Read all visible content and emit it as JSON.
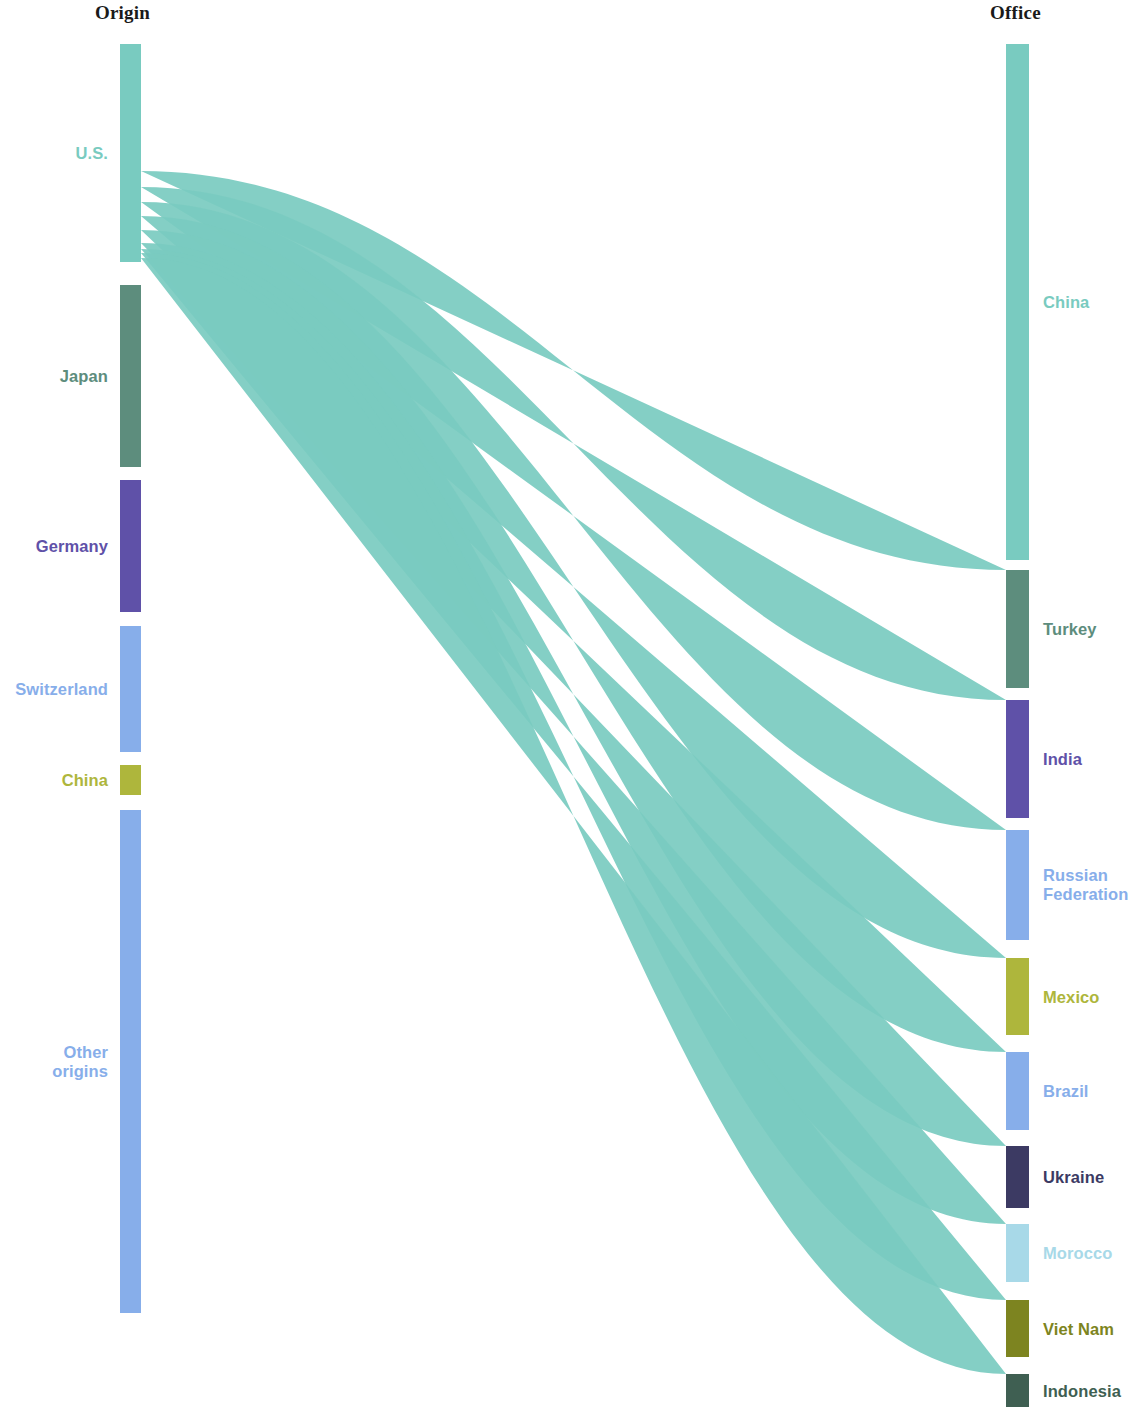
{
  "headers": {
    "left": "Origin",
    "right": "Office"
  },
  "palette": {
    "teal": "#79cbc0",
    "dark_green": "#5d8d7d",
    "purple": "#5f51a8",
    "light_blue": "#87aeea",
    "olive": "#aeb63c",
    "navy": "#3c3a63",
    "pale_blue": "#a8d9e8",
    "dark_olive": "#7d8420",
    "deep_green": "#3f5f52",
    "pale_sky": "#b7dceb"
  },
  "chart_data": {
    "type": "sankey",
    "title": "",
    "left_axis_label": "Origin",
    "right_axis_label": "Office",
    "units": "share of flows (relative width)",
    "nodes_left": [
      {
        "id": "us",
        "label": "U.S.",
        "color": "#79cbc0",
        "y0": 44,
        "y1": 262,
        "value": 218
      },
      {
        "id": "japan",
        "label": "Japan",
        "color": "#5d8d7d",
        "y0": 285,
        "y1": 467,
        "value": 182
      },
      {
        "id": "germany",
        "label": "Germany",
        "color": "#5f51a8",
        "y0": 480,
        "y1": 612,
        "value": 132
      },
      {
        "id": "switzerland",
        "label": "Switzerland",
        "color": "#87aeea",
        "y0": 626,
        "y1": 752,
        "value": 126
      },
      {
        "id": "china_o",
        "label": "China",
        "color": "#aeb63c",
        "y0": 765,
        "y1": 795,
        "value": 30
      },
      {
        "id": "other",
        "label": "Other\norigins",
        "color": "#87aeea",
        "y0": 810,
        "y1": 1313,
        "value": 503
      }
    ],
    "nodes_right": [
      {
        "id": "china",
        "label": "China",
        "color": "#79cbc0",
        "y0": 44,
        "y1": 560,
        "value": 516
      },
      {
        "id": "turkey",
        "label": "Turkey",
        "color": "#5d8d7d",
        "y0": 570,
        "y1": 688,
        "value": 118
      },
      {
        "id": "india",
        "label": "India",
        "color": "#5f51a8",
        "y0": 700,
        "y1": 818,
        "value": 118
      },
      {
        "id": "russia",
        "label": "Russian\nFederation",
        "color": "#87aeea",
        "y0": 830,
        "y1": 940,
        "value": 110
      },
      {
        "id": "mexico",
        "label": "Mexico",
        "color": "#aeb63c",
        "y0": 958,
        "y1": 1035,
        "value": 77
      },
      {
        "id": "brazil",
        "label": "Brazil",
        "color": "#87aeea",
        "y0": 1052,
        "y1": 1130,
        "value": 78
      },
      {
        "id": "ukraine",
        "label": "Ukraine",
        "color": "#3c3a63",
        "y0": 1146,
        "y1": 1208,
        "value": 62
      },
      {
        "id": "morocco",
        "label": "Morocco",
        "color": "#a8d9e8",
        "y0": 1224,
        "y1": 1282,
        "value": 58
      },
      {
        "id": "vietnam",
        "label": "Viet Nam",
        "color": "#7d8420",
        "y0": 1300,
        "y1": 1357,
        "value": 57
      },
      {
        "id": "indonesia",
        "label": "Indonesia",
        "color": "#3f5f52",
        "y0": 1374,
        "y1": 1407,
        "value": 33
      }
    ],
    "links": [
      {
        "source": "us",
        "target": "china",
        "value": 127
      },
      {
        "source": "us",
        "target": "turkey",
        "value": 16
      },
      {
        "source": "us",
        "target": "india",
        "value": 15
      },
      {
        "source": "us",
        "target": "russia",
        "value": 14
      },
      {
        "source": "us",
        "target": "mexico",
        "value": 14
      },
      {
        "source": "us",
        "target": "brazil",
        "value": 13
      },
      {
        "source": "us",
        "target": "ukraine",
        "value": 6
      },
      {
        "source": "us",
        "target": "morocco",
        "value": 4
      },
      {
        "source": "us",
        "target": "vietnam",
        "value": 5
      },
      {
        "source": "us",
        "target": "indonesia",
        "value": 4
      },
      {
        "source": "japan",
        "target": "china",
        "value": 112
      },
      {
        "source": "japan",
        "target": "turkey",
        "value": 12
      },
      {
        "source": "japan",
        "target": "india",
        "value": 11
      },
      {
        "source": "japan",
        "target": "russia",
        "value": 10
      },
      {
        "source": "japan",
        "target": "mexico",
        "value": 9
      },
      {
        "source": "japan",
        "target": "brazil",
        "value": 9
      },
      {
        "source": "japan",
        "target": "ukraine",
        "value": 5
      },
      {
        "source": "japan",
        "target": "morocco",
        "value": 4
      },
      {
        "source": "japan",
        "target": "vietnam",
        "value": 5
      },
      {
        "source": "japan",
        "target": "indonesia",
        "value": 5
      },
      {
        "source": "germany",
        "target": "china",
        "value": 47
      },
      {
        "source": "germany",
        "target": "turkey",
        "value": 18
      },
      {
        "source": "germany",
        "target": "india",
        "value": 17
      },
      {
        "source": "germany",
        "target": "russia",
        "value": 15
      },
      {
        "source": "germany",
        "target": "mexico",
        "value": 9
      },
      {
        "source": "germany",
        "target": "brazil",
        "value": 10
      },
      {
        "source": "germany",
        "target": "ukraine",
        "value": 7
      },
      {
        "source": "germany",
        "target": "morocco",
        "value": 3
      },
      {
        "source": "germany",
        "target": "vietnam",
        "value": 3
      },
      {
        "source": "germany",
        "target": "indonesia",
        "value": 3
      },
      {
        "source": "switzerland",
        "target": "china",
        "value": 70
      },
      {
        "source": "switzerland",
        "target": "turkey",
        "value": 12
      },
      {
        "source": "switzerland",
        "target": "india",
        "value": 10
      },
      {
        "source": "switzerland",
        "target": "russia",
        "value": 10
      },
      {
        "source": "switzerland",
        "target": "mexico",
        "value": 5
      },
      {
        "source": "switzerland",
        "target": "brazil",
        "value": 6
      },
      {
        "source": "switzerland",
        "target": "ukraine",
        "value": 5
      },
      {
        "source": "switzerland",
        "target": "morocco",
        "value": 3
      },
      {
        "source": "switzerland",
        "target": "vietnam",
        "value": 3
      },
      {
        "source": "switzerland",
        "target": "indonesia",
        "value": 2
      },
      {
        "source": "china_o",
        "target": "india",
        "value": 4
      },
      {
        "source": "china_o",
        "target": "russia",
        "value": 4
      },
      {
        "source": "china_o",
        "target": "mexico",
        "value": 5
      },
      {
        "source": "china_o",
        "target": "brazil",
        "value": 4
      },
      {
        "source": "china_o",
        "target": "ukraine",
        "value": 3
      },
      {
        "source": "china_o",
        "target": "morocco",
        "value": 3
      },
      {
        "source": "china_o",
        "target": "vietnam",
        "value": 4
      },
      {
        "source": "china_o",
        "target": "indonesia",
        "value": 3
      },
      {
        "source": "other",
        "target": "china",
        "value": 160
      },
      {
        "source": "other",
        "target": "turkey",
        "value": 60
      },
      {
        "source": "other",
        "target": "india",
        "value": 61
      },
      {
        "source": "other",
        "target": "russia",
        "value": 57
      },
      {
        "source": "other",
        "target": "mexico",
        "value": 35
      },
      {
        "source": "other",
        "target": "brazil",
        "value": 36
      },
      {
        "source": "other",
        "target": "ukraine",
        "value": 36
      },
      {
        "source": "other",
        "target": "morocco",
        "value": 41
      },
      {
        "source": "other",
        "target": "vietnam",
        "value": 37
      },
      {
        "source": "other",
        "target": "indonesia",
        "value": 16
      }
    ],
    "geometry": {
      "left_node_x0": 120,
      "left_node_x1": 141,
      "right_node_x0": 1006,
      "right_node_x1": 1029,
      "canvas_width": 1147,
      "canvas_height": 1407
    }
  }
}
